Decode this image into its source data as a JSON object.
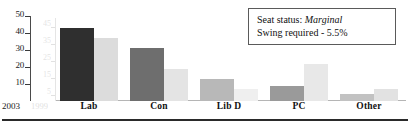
{
  "chart_data": {
    "type": "bar",
    "title": "",
    "xlabel": "",
    "ylabel": "",
    "categories": [
      "Lab",
      "Con",
      "Lib D",
      "PC",
      "Other"
    ],
    "series": [
      {
        "name": "2003",
        "values": [
          43,
          31,
          13,
          9,
          4
        ],
        "color": "#303030"
      },
      {
        "name": "1999",
        "values": [
          37,
          19,
          7,
          22,
          7
        ],
        "color": "#d9d9d9"
      }
    ],
    "series_colors_by_category": {
      "2003": [
        "#2f2f2f",
        "#6e6e6e",
        "#b8b8b8",
        "#9a9a9a",
        "#c2c2c2"
      ],
      "1999": [
        "#dcdcdc",
        "#e4e4e4",
        "#efefef",
        "#e8e8e8",
        "#e2e2e2"
      ]
    },
    "ylim": [
      0,
      50
    ],
    "yticks": [
      10,
      20,
      30,
      40,
      50
    ],
    "yticks_secondary": [
      5,
      15,
      25,
      35,
      45
    ],
    "grid": false,
    "legend": "none"
  },
  "axis": {
    "primary_ticks": [
      "50",
      "40",
      "30",
      "20",
      "10"
    ],
    "secondary_ticks": [
      "45",
      "35",
      "25",
      "15",
      "5"
    ],
    "corner_year_primary": "2003",
    "corner_year_secondary": "1999"
  },
  "annotation": {
    "line1_prefix": "Seat status: ",
    "line1_emphasis": "Marginal",
    "line2": "Swing required - 5.5%"
  },
  "colors": {
    "axis_text": "#1a1a1a",
    "annotation_border": "#5a5a5a",
    "bottom_rule": "#2a2a2a"
  }
}
